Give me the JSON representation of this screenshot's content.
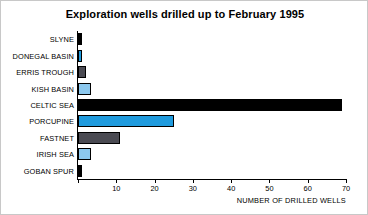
{
  "chart_data": {
    "type": "bar",
    "orientation": "horizontal",
    "title": "Exploration wells drilled up to February 1995",
    "xlabel": "NUMBER OF DRILLED WELLS",
    "ylabel": "",
    "xlim": [
      0,
      70
    ],
    "xticks": [
      0,
      10,
      20,
      30,
      40,
      50,
      60,
      70
    ],
    "xticklabels": [
      "",
      "10",
      "20",
      "30",
      "40",
      "50",
      "60",
      "70"
    ],
    "grid": false,
    "legend": false,
    "categories": [
      "SLYNE",
      "DONEGAL BASIN",
      "ERRIS TROUGH",
      "KISH BASIN",
      "CELTIC SEA",
      "PORCUPINE",
      "FASTNET",
      "IRISH SEA",
      "GOBAN SPUR"
    ],
    "values": [
      1,
      1,
      2,
      3.5,
      69,
      25,
      11,
      3.5,
      1
    ],
    "bar_colors": [
      "#000000",
      "#1F9BDE",
      "#4A4A52",
      "#8CC8EE",
      "#000000",
      "#1F9BDE",
      "#4A4A52",
      "#8CC8EE",
      "#000000"
    ],
    "bars": [
      {
        "label": "SLYNE",
        "value": 1,
        "color": "#000000"
      },
      {
        "label": "DONEGAL BASIN",
        "value": 1,
        "color": "#1F9BDE"
      },
      {
        "label": "ERRIS TROUGH",
        "value": 2,
        "color": "#4A4A52"
      },
      {
        "label": "KISH BASIN",
        "value": 3.5,
        "color": "#8CC8EE"
      },
      {
        "label": "CELTIC SEA",
        "value": 69,
        "color": "#000000"
      },
      {
        "label": "PORCUPINE",
        "value": 25,
        "color": "#1F9BDE"
      },
      {
        "label": "FASTNET",
        "value": 11,
        "color": "#4A4A52"
      },
      {
        "label": "IRISH SEA",
        "value": 3.5,
        "color": "#8CC8EE"
      },
      {
        "label": "GOBAN SPUR",
        "value": 1,
        "color": "#000000"
      }
    ],
    "axis_color": "#000000",
    "background_color": "#ffffff"
  }
}
